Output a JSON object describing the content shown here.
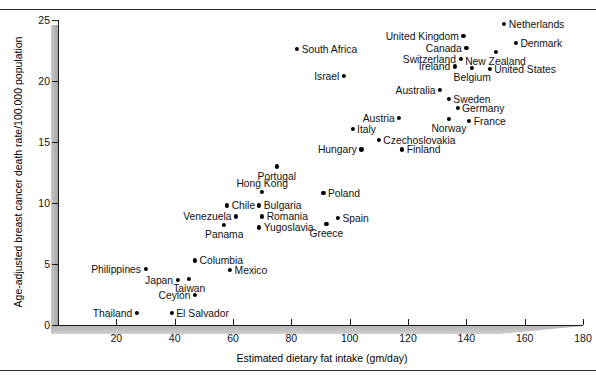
{
  "figure": {
    "rules": [
      "top-rule",
      "bottom-rule"
    ]
  },
  "chart_data": {
    "type": "scatter",
    "title": "",
    "xlabel": "Estimated dietary fat intake (gm/day)",
    "ylabel": "Age-adjusted breast cancer death rate/100,000 population",
    "xlim": [
      0,
      180
    ],
    "ylim": [
      0,
      25
    ],
    "xticks": [
      20,
      40,
      60,
      80,
      100,
      120,
      140,
      160,
      180
    ],
    "yticks": [
      0,
      5,
      10,
      15,
      20,
      25
    ],
    "grid": false,
    "legend": null,
    "marker_color": "#000000",
    "points": [
      {
        "label": "Netherlands",
        "x": 153,
        "y": 24.7,
        "side": "right"
      },
      {
        "label": "United Kingdom",
        "x": 139,
        "y": 23.7,
        "side": "left"
      },
      {
        "label": "Denmark",
        "x": 157,
        "y": 23.1,
        "side": "right"
      },
      {
        "label": "Canada",
        "x": 140,
        "y": 22.7,
        "side": "left"
      },
      {
        "label": "New Zealand",
        "x": 150,
        "y": 22.4,
        "side": "below"
      },
      {
        "label": "South Africa",
        "x": 82,
        "y": 22.6,
        "side": "right"
      },
      {
        "label": "Switzerland",
        "x": 138,
        "y": 21.8,
        "side": "left"
      },
      {
        "label": "Ireland",
        "x": 136,
        "y": 21.2,
        "side": "left"
      },
      {
        "label": "Belgium",
        "x": 142,
        "y": 21.1,
        "side": "below"
      },
      {
        "label": "United States",
        "x": 148,
        "y": 21.0,
        "side": "right"
      },
      {
        "label": "Israel",
        "x": 98,
        "y": 20.4,
        "side": "left"
      },
      {
        "label": "Australia",
        "x": 131,
        "y": 19.3,
        "side": "left"
      },
      {
        "label": "Sweden",
        "x": 134,
        "y": 18.5,
        "side": "right"
      },
      {
        "label": "Germany",
        "x": 137,
        "y": 17.8,
        "side": "right"
      },
      {
        "label": "Austria",
        "x": 117,
        "y": 17.0,
        "side": "left"
      },
      {
        "label": "Norway",
        "x": 134,
        "y": 16.9,
        "side": "below"
      },
      {
        "label": "France",
        "x": 141,
        "y": 16.7,
        "side": "right"
      },
      {
        "label": "Italy",
        "x": 101,
        "y": 16.1,
        "side": "right"
      },
      {
        "label": "Czechoslovakia",
        "x": 110,
        "y": 15.2,
        "side": "right"
      },
      {
        "label": "Hungary",
        "x": 104,
        "y": 14.4,
        "side": "left"
      },
      {
        "label": "Finland",
        "x": 118,
        "y": 14.4,
        "side": "right"
      },
      {
        "label": "Portugal",
        "x": 75,
        "y": 13.0,
        "side": "below"
      },
      {
        "label": "Hong Kong",
        "x": 70,
        "y": 10.9,
        "side": "above"
      },
      {
        "label": "Poland",
        "x": 91,
        "y": 10.8,
        "side": "right"
      },
      {
        "label": "Bulgaria",
        "x": 69,
        "y": 9.8,
        "side": "right"
      },
      {
        "label": "Chile",
        "x": 58,
        "y": 9.8,
        "side": "right"
      },
      {
        "label": "Venezuela",
        "x": 61,
        "y": 8.9,
        "side": "left"
      },
      {
        "label": "Romania",
        "x": 70,
        "y": 8.9,
        "side": "right"
      },
      {
        "label": "Spain",
        "x": 96,
        "y": 8.8,
        "side": "right"
      },
      {
        "label": "Panama",
        "x": 57,
        "y": 8.2,
        "side": "below"
      },
      {
        "label": "Greece",
        "x": 92,
        "y": 8.3,
        "side": "below"
      },
      {
        "label": "Yugoslavia",
        "x": 69,
        "y": 8.0,
        "side": "right"
      },
      {
        "label": "Columbia",
        "x": 47,
        "y": 5.3,
        "side": "right"
      },
      {
        "label": "Philippines",
        "x": 30,
        "y": 4.6,
        "side": "left"
      },
      {
        "label": "Mexico",
        "x": 59,
        "y": 4.5,
        "side": "right"
      },
      {
        "label": "Taiwan",
        "x": 45,
        "y": 3.8,
        "side": "below"
      },
      {
        "label": "Japan",
        "x": 41,
        "y": 3.7,
        "side": "left"
      },
      {
        "label": "Ceylon",
        "x": 47,
        "y": 2.5,
        "side": "left"
      },
      {
        "label": "Thailand",
        "x": 27,
        "y": 1.0,
        "side": "left"
      },
      {
        "label": "El Salvador",
        "x": 39,
        "y": 1.0,
        "side": "right"
      }
    ]
  }
}
